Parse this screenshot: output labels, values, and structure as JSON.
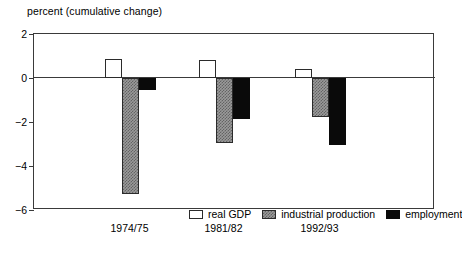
{
  "chart_data": {
    "type": "bar",
    "title": "percent (cumulative change)",
    "subtitle": "",
    "xlabel": "",
    "ylabel": "",
    "categories": [
      "1974/75",
      "1981/82",
      "1992/93"
    ],
    "series": [
      {
        "name": "real GDP",
        "color": "#ffffff",
        "values": [
          0.85,
          0.8,
          0.4
        ]
      },
      {
        "name": "industrial production",
        "color": "#9a9a9a",
        "values": [
          -5.25,
          -2.95,
          -1.75
        ]
      },
      {
        "name": "employment",
        "color": "#0a0a0a",
        "values": [
          -0.55,
          -1.85,
          -3.05
        ]
      }
    ],
    "ylim": [
      -6,
      2
    ],
    "yticks": [
      2,
      0,
      -2,
      -4,
      -6
    ],
    "ytick_labels": [
      "2",
      "0",
      "−2",
      "−4",
      "−6"
    ],
    "grid": false,
    "zero_line": true,
    "legend_position": "inside-bottom-right",
    "frame": true
  },
  "axis": {
    "y_axis_name": "y-axis",
    "x_axis_name": "x-axis"
  },
  "legend": {
    "items": [
      {
        "label": "real GDP",
        "swatch": "white-square-swatch"
      },
      {
        "label": "industrial production",
        "swatch": "gray-square-swatch"
      },
      {
        "label": "employment",
        "swatch": "black-square-swatch"
      }
    ]
  }
}
